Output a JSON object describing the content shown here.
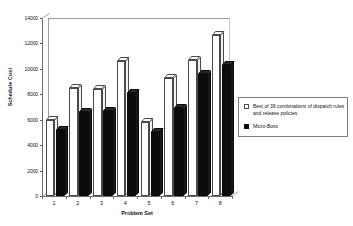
{
  "chart_data": {
    "type": "bar",
    "title": "",
    "xlabel": "Problem Set",
    "ylabel": "Schedule Cost",
    "categories": [
      "1",
      "2",
      "3",
      "4",
      "5",
      "6",
      "7",
      "8"
    ],
    "ylim": [
      0,
      14000
    ],
    "yticks": [
      "0",
      "2000",
      "4000",
      "6000",
      "8000",
      "10000",
      "12000",
      "14000"
    ],
    "ytick_values": [
      0,
      2000,
      4000,
      6000,
      8000,
      10000,
      12000,
      14000
    ],
    "grid": false,
    "legend_position": "right",
    "series": [
      {
        "name": "Best of 39 combinations of dispatch rules and release policies",
        "color": "#ffffff",
        "values": [
          6000,
          8500,
          8450,
          10600,
          5850,
          9250,
          10700,
          12700
        ]
      },
      {
        "name": "Micro-Boss",
        "color": "#0b0b0b",
        "values": [
          5200,
          6600,
          6700,
          8100,
          5000,
          6950,
          9600,
          10300
        ]
      }
    ]
  },
  "legend": {
    "items": [
      {
        "label": "Best of 39 combinations of dispatch rules and release policies",
        "swatch": "white"
      },
      {
        "label": "Micro-Boss",
        "swatch": "black"
      }
    ]
  }
}
